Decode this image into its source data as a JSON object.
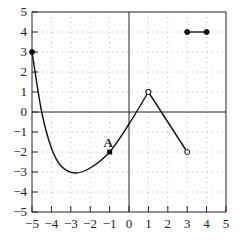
{
  "chart_data": {
    "type": "line",
    "title": "",
    "xlabel": "",
    "ylabel": "",
    "xlim": [
      -5,
      5
    ],
    "ylim": [
      -5,
      5
    ],
    "grid": "dotted",
    "x_ticks": [
      "-5",
      "-4",
      "-3",
      "-2",
      "-1",
      "0",
      "1",
      "2",
      "3",
      "4",
      "5"
    ],
    "y_ticks": [
      "5",
      "4",
      "3",
      "2",
      "1",
      "0",
      "-1",
      "-2",
      "-3",
      "-4",
      "-5"
    ],
    "series": [
      {
        "name": "curve",
        "kind": "smooth",
        "points": [
          [
            -5,
            3
          ],
          [
            -4.5,
            0
          ],
          [
            -4,
            -1.8
          ],
          [
            -3.5,
            -2.7
          ],
          [
            -2.8,
            -3.05
          ],
          [
            -2,
            -2.8
          ],
          [
            -1,
            -2
          ],
          [
            0,
            -0.6
          ],
          [
            1,
            1
          ]
        ],
        "start": "closed",
        "end": "open"
      },
      {
        "name": "segment",
        "kind": "line",
        "points": [
          [
            1,
            1
          ],
          [
            3,
            -2
          ]
        ],
        "start": "open",
        "end": "open"
      },
      {
        "name": "horizontal segment",
        "kind": "line",
        "points": [
          [
            3,
            4
          ],
          [
            4,
            4
          ]
        ],
        "start": "closed",
        "end": "closed"
      }
    ],
    "annotations": [
      {
        "text": "A",
        "x": -1,
        "y": -2,
        "marker": "square"
      }
    ]
  }
}
